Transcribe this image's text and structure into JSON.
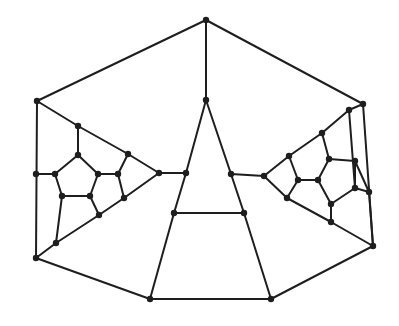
{
  "diagram": {
    "type": "graph",
    "style": {
      "edge_color": "#1e1e1e",
      "node_color": "#1e1e1e",
      "node_radius": 3.2,
      "edge_width": 2
    },
    "nodes": {
      "T": [
        206,
        20
      ],
      "LT": [
        37,
        101
      ],
      "RT": [
        363,
        104
      ],
      "LB": [
        36,
        258
      ],
      "RB": [
        373,
        246
      ],
      "BL": [
        150,
        299
      ],
      "BR": [
        271,
        299
      ],
      "A0": [
        206,
        100
      ],
      "A1": [
        186,
        173
      ],
      "A2": [
        231,
        174
      ],
      "A3": [
        174,
        213
      ],
      "A4": [
        244,
        213
      ],
      "Ltip": [
        159,
        173
      ],
      "L1": [
        78,
        126
      ],
      "L2": [
        128,
        154
      ],
      "L3": [
        78,
        155
      ],
      "L4": [
        36,
        174
      ],
      "L5": [
        55,
        174
      ],
      "L6": [
        98,
        174
      ],
      "L7": [
        118,
        174
      ],
      "L8": [
        62,
        196
      ],
      "L9": [
        90,
        196
      ],
      "L10": [
        124,
        198
      ],
      "L11": [
        99,
        215
      ],
      "L12": [
        56,
        243
      ],
      "Rtip": [
        264,
        176
      ],
      "R1": [
        289,
        156
      ],
      "R2": [
        322,
        133
      ],
      "R3": [
        349,
        110
      ],
      "R4": [
        298,
        180
      ],
      "R5": [
        318,
        180
      ],
      "R6": [
        329,
        159
      ],
      "R7": [
        355,
        161
      ],
      "R8": [
        355,
        188
      ],
      "R9": [
        369,
        192
      ],
      "R10": [
        331,
        204
      ],
      "R11": [
        331,
        222
      ],
      "R12": [
        287,
        198
      ]
    },
    "edges": [
      [
        "T",
        "LT"
      ],
      [
        "T",
        "RT"
      ],
      [
        "T",
        "A0"
      ],
      [
        "LT",
        "LB"
      ],
      [
        "RT",
        "RB"
      ],
      [
        "LB",
        "BL"
      ],
      [
        "BL",
        "BR"
      ],
      [
        "BR",
        "RB"
      ],
      [
        "A0",
        "A1"
      ],
      [
        "A1",
        "A3"
      ],
      [
        "A0",
        "A2"
      ],
      [
        "A2",
        "A4"
      ],
      [
        "A3",
        "A4"
      ],
      [
        "A3",
        "BL"
      ],
      [
        "A4",
        "BR"
      ],
      [
        "Ltip",
        "A1"
      ],
      [
        "Rtip",
        "A2"
      ],
      [
        "LT",
        "L1"
      ],
      [
        "L1",
        "L2"
      ],
      [
        "L2",
        "Ltip"
      ],
      [
        "L1",
        "L3"
      ],
      [
        "L3",
        "L5"
      ],
      [
        "L3",
        "L6"
      ],
      [
        "L4",
        "L5"
      ],
      [
        "L5",
        "L8"
      ],
      [
        "L8",
        "L9"
      ],
      [
        "L9",
        "L6"
      ],
      [
        "L6",
        "L7"
      ],
      [
        "L7",
        "L2"
      ],
      [
        "L7",
        "L10"
      ],
      [
        "L9",
        "L11"
      ],
      [
        "L8",
        "L12"
      ],
      [
        "LB",
        "L12"
      ],
      [
        "L12",
        "L11"
      ],
      [
        "L11",
        "L10"
      ],
      [
        "L10",
        "Ltip"
      ],
      [
        "RT",
        "R3"
      ],
      [
        "R3",
        "R2"
      ],
      [
        "R2",
        "R1"
      ],
      [
        "R1",
        "Rtip"
      ],
      [
        "R3",
        "R8"
      ],
      [
        "R2",
        "R6"
      ],
      [
        "R6",
        "R7"
      ],
      [
        "R6",
        "R5"
      ],
      [
        "R1",
        "R4"
      ],
      [
        "R4",
        "R5"
      ],
      [
        "R4",
        "R12"
      ],
      [
        "R5",
        "R10"
      ],
      [
        "R10",
        "R8"
      ],
      [
        "R8",
        "R9"
      ],
      [
        "R7",
        "R8"
      ],
      [
        "R10",
        "R11"
      ],
      [
        "Rtip",
        "R12"
      ],
      [
        "R12",
        "R11"
      ],
      [
        "R11",
        "RB"
      ],
      [
        "R9",
        "RB"
      ],
      [
        "R9",
        "R7"
      ]
    ]
  }
}
